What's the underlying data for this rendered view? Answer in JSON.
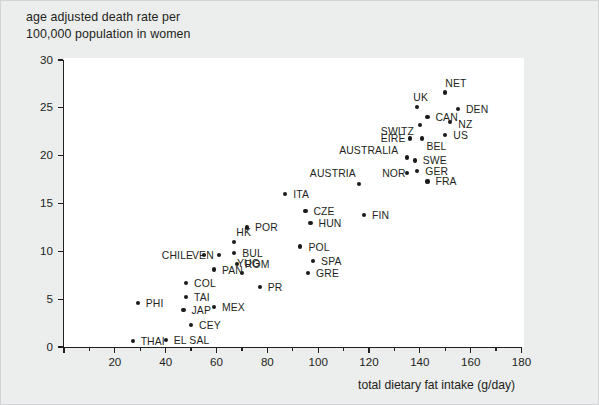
{
  "figure": {
    "title_lines": [
      "age adjusted death rate  per",
      "100,000 population in women"
    ],
    "background_color": "#eceded",
    "plot_background_color": "#ffffff",
    "marker_color": "#1a1a1a",
    "axis_color": "#231f20"
  },
  "chart_data": {
    "type": "scatter",
    "title": "age adjusted death rate  per 100,000 population in women",
    "xlabel": "total dietary fat intake (g/day)",
    "ylabel": "age adjusted death rate per 100,000 population in women",
    "xlim": [
      0,
      180
    ],
    "ylim": [
      0,
      30
    ],
    "xticks": [
      0,
      20,
      40,
      60,
      80,
      100,
      120,
      140,
      160,
      180
    ],
    "xticks_minor": [
      10,
      30,
      50,
      70,
      90,
      110,
      130,
      150,
      170
    ],
    "yticks": [
      0,
      5,
      10,
      15,
      20,
      25,
      30
    ],
    "xtick_labels": [
      "",
      "20",
      "40",
      "60",
      "80",
      "100",
      "120",
      "140",
      "160",
      "180"
    ],
    "ytick_labels": [
      "0",
      "5",
      "10",
      "15",
      "20",
      "25",
      "30"
    ],
    "grid": false,
    "legend": false,
    "points": [
      {
        "label": "THAI",
        "x": 27,
        "y": 0.6,
        "lx": 8,
        "ly": -5
      },
      {
        "label": "EL SAL",
        "x": 40,
        "y": 0.7,
        "lx": 8,
        "ly": -5
      },
      {
        "label": "CEY",
        "x": 50,
        "y": 2.3,
        "lx": 8,
        "ly": -5
      },
      {
        "label": "JAP",
        "x": 47,
        "y": 3.9,
        "lx": 8,
        "ly": -5
      },
      {
        "label": "PHI",
        "x": 29,
        "y": 4.6,
        "lx": 8,
        "ly": -5
      },
      {
        "label": "TAI",
        "x": 48,
        "y": 5.2,
        "lx": 8,
        "ly": -5
      },
      {
        "label": "MEX",
        "x": 59,
        "y": 4.2,
        "lx": 8,
        "ly": -5
      },
      {
        "label": "COL",
        "x": 48,
        "y": 6.7,
        "lx": 8,
        "ly": -5
      },
      {
        "label": "PR",
        "x": 77,
        "y": 6.3,
        "lx": 8,
        "ly": -5
      },
      {
        "label": "YUG",
        "x": 70,
        "y": 7.7,
        "lx": -5,
        "ly": -15
      },
      {
        "label": "GRE",
        "x": 96,
        "y": 7.7,
        "lx": 8,
        "ly": -5
      },
      {
        "label": "PAN",
        "x": 59,
        "y": 8.1,
        "lx": 8,
        "ly": -5
      },
      {
        "label": "ROM",
        "x": 68,
        "y": 8.7,
        "lx": 8,
        "ly": -5
      },
      {
        "label": "SPA",
        "x": 98,
        "y": 9.0,
        "lx": 8,
        "ly": -5
      },
      {
        "label": "VEN",
        "x": 61,
        "y": 9.6,
        "lx": -27,
        "ly": -5
      },
      {
        "label": "CHILE",
        "x": 55,
        "y": 9.6,
        "lx": -42,
        "ly": -5
      },
      {
        "label": "BUL",
        "x": 67,
        "y": 9.8,
        "lx": 8,
        "ly": -5
      },
      {
        "label": "HK",
        "x": 67,
        "y": 11.0,
        "lx": 2,
        "ly": -15
      },
      {
        "label": "POL",
        "x": 93,
        "y": 10.5,
        "lx": 8,
        "ly": -5
      },
      {
        "label": "POR",
        "x": 72,
        "y": 12.5,
        "lx": 8,
        "ly": -5
      },
      {
        "label": "HUN",
        "x": 97,
        "y": 13.0,
        "lx": 8,
        "ly": -5
      },
      {
        "label": "CZE",
        "x": 95,
        "y": 14.2,
        "lx": 8,
        "ly": -5
      },
      {
        "label": "FIN",
        "x": 118,
        "y": 13.8,
        "lx": 8,
        "ly": -5
      },
      {
        "label": "ITA",
        "x": 87,
        "y": 16.0,
        "lx": 8,
        "ly": -5
      },
      {
        "label": "AUSTRIA",
        "x": 116,
        "y": 17.0,
        "lx": -49,
        "ly": -16
      },
      {
        "label": "FRA",
        "x": 143,
        "y": 17.3,
        "lx": 8,
        "ly": -5
      },
      {
        "label": "NOR",
        "x": 135,
        "y": 18.2,
        "lx": -25,
        "ly": -5
      },
      {
        "label": "GER",
        "x": 139,
        "y": 18.4,
        "lx": 8,
        "ly": -5
      },
      {
        "label": "AUSTRALIA",
        "x": 135,
        "y": 19.8,
        "lx": -68,
        "ly": -13
      },
      {
        "label": "SWE",
        "x": 138,
        "y": 19.5,
        "lx": 8,
        "ly": -5
      },
      {
        "label": "EIRE",
        "x": 136,
        "y": 21.8,
        "lx": -29,
        "ly": -5
      },
      {
        "label": "BEL",
        "x": 141,
        "y": 21.8,
        "lx": 4,
        "ly": 3
      },
      {
        "label": "US",
        "x": 150,
        "y": 22.2,
        "lx": 8,
        "ly": -5
      },
      {
        "label": "SWITZ",
        "x": 140,
        "y": 23.2,
        "lx": -39,
        "ly": 1
      },
      {
        "label": "NZ",
        "x": 152,
        "y": 23.5,
        "lx": 8,
        "ly": -3
      },
      {
        "label": "CAN",
        "x": 143,
        "y": 24.0,
        "lx": 8,
        "ly": -5
      },
      {
        "label": "UK",
        "x": 139,
        "y": 25.1,
        "lx": -4,
        "ly": -15
      },
      {
        "label": "DEN",
        "x": 155,
        "y": 24.9,
        "lx": 8,
        "ly": -5
      },
      {
        "label": "NET",
        "x": 150,
        "y": 26.6,
        "lx": 0,
        "ly": -15
      }
    ]
  }
}
